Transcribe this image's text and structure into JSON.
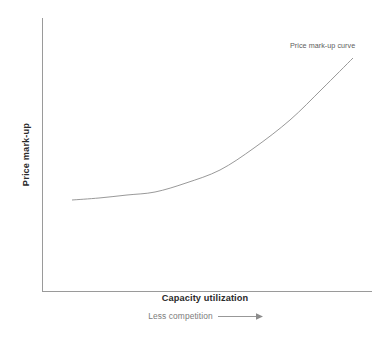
{
  "chart_data": {
    "type": "line",
    "title": "",
    "xlabel": "Capacity utilization",
    "xsublabel": "Less competition",
    "ylabel": "Price mark-up",
    "grid": false,
    "legend_position": "inline-annotation",
    "annotations": [
      {
        "text": "Price mark-up curve",
        "x": 0.86,
        "y": 0.96
      }
    ],
    "xlim": [
      0,
      1
    ],
    "ylim": [
      0,
      1
    ],
    "axis_tick_labels": {
      "x": [],
      "y": []
    },
    "series": [
      {
        "name": "Price mark-up curve",
        "x": [
          0.09,
          0.17,
          0.26,
          0.34,
          0.43,
          0.54,
          0.65,
          0.76,
          0.86,
          0.94
        ],
        "y": [
          0.33,
          0.34,
          0.37,
          0.41,
          0.47,
          0.55,
          0.65,
          0.76,
          0.86,
          0.93
        ],
        "points_px": [
          [
            72,
            200
          ],
          [
            99,
            198
          ],
          [
            127,
            195
          ],
          [
            155,
            192
          ],
          [
            186,
            183
          ],
          [
            220,
            170
          ],
          [
            254,
            148
          ],
          [
            290,
            120
          ],
          [
            322,
            89
          ],
          [
            353,
            58
          ]
        ]
      }
    ]
  },
  "axes": {
    "origin_px": [
      42,
      291
    ],
    "y_top_px": 18,
    "x_right_px": 372,
    "axis_color": "#9a9a9a",
    "curve_color": "#8d8d8d",
    "label_color": "#2b2b2b",
    "sublabel_color": "#7c7c7c",
    "annotation_color": "#5d5d5d",
    "background_color": "#ffffff"
  },
  "icons": {
    "direction_arrow": "right-arrow-icon"
  }
}
